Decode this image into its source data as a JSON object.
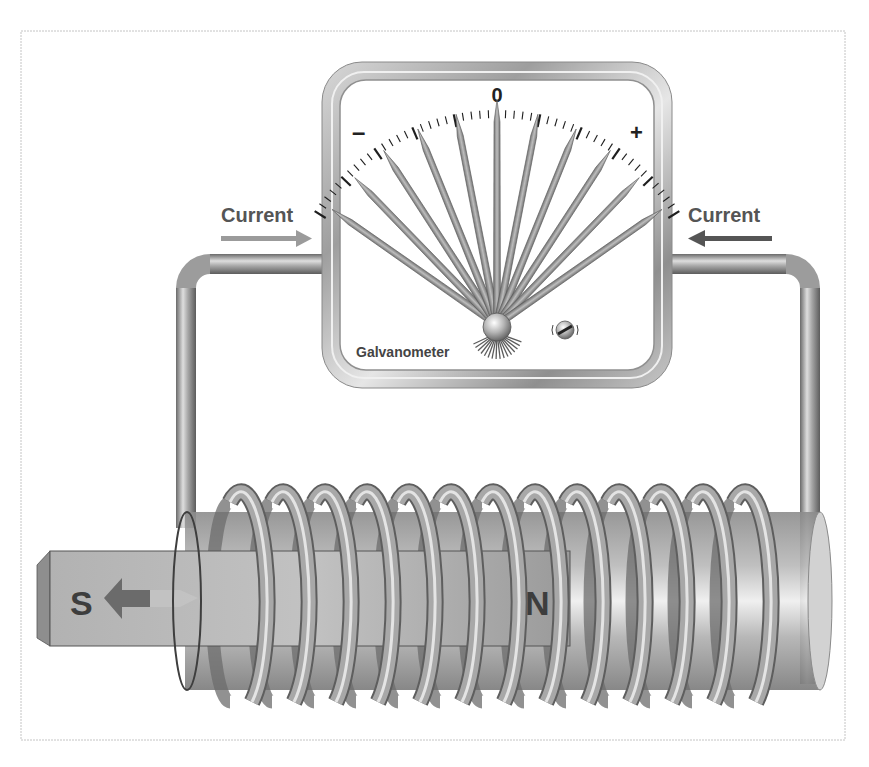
{
  "diagram": {
    "frame": {
      "x": 21,
      "y": 31,
      "width": 824,
      "height": 709
    }
  },
  "galvanometer": {
    "label": "Galvanometer",
    "scale": {
      "zero_label": "0",
      "negative_label": "–",
      "positive_label": "+",
      "arc_start_deg": -58,
      "arc_end_deg": 58,
      "major_tick_count": 11,
      "minor_per_major": 4
    },
    "needle_count": 11,
    "needle_spread_deg": [
      -55,
      -44,
      -33,
      -22,
      -11,
      0,
      11,
      22,
      33,
      44,
      55
    ],
    "pivot": {
      "x": 497,
      "y": 325
    },
    "zero_adjust_screw": "zero-adjust-screw"
  },
  "current_labels": {
    "left": {
      "text": "Current",
      "direction": "right"
    },
    "right": {
      "text": "Current",
      "direction": "left"
    }
  },
  "magnet": {
    "south_label": "S",
    "north_label": "N",
    "motion_direction": "left"
  },
  "coil": {
    "turns": 13,
    "start_x": 222,
    "spacing": 42
  },
  "colors": {
    "wire": "#9a9a9a",
    "wire_highlight": "#e2e2e2",
    "wire_shadow": "#5e5e5e",
    "left_arrow": "#9b9b9b",
    "right_arrow": "#555555",
    "magnet_body": "#a9a9a9",
    "core": "#bdbdbd",
    "frame": "#bdbdbd"
  }
}
